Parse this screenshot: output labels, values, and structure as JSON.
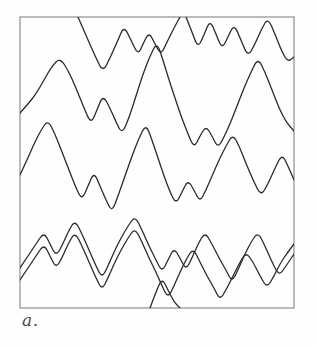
{
  "figure": {
    "panel_label": "a.",
    "caption_position": "bottom-left-outside",
    "background_color": "#fefefe",
    "frame": {
      "x": 20,
      "y": 17,
      "width": 274,
      "height": 291,
      "stroke_color": "#8e8e8e",
      "stroke_width": 1.2
    },
    "trace_style": {
      "stroke_color": "#2b2b2b",
      "stroke_width": 1.3,
      "fill": "none",
      "line_join": "round",
      "line_cap": "round"
    }
  },
  "chart_data": {
    "type": "line",
    "title": "",
    "subtitle": "",
    "xlabel": "",
    "ylabel": "",
    "grid": false,
    "legend": null,
    "axis_ticks": false,
    "xlim": [
      20,
      294
    ],
    "ylim": [
      17,
      308
    ],
    "series": [
      {
        "name": "trace-1",
        "comment": "Topmost trace, enters at top edge, oscillates sharply near top, exits right at top.",
        "path": "M 78 17 L 88 40 L 96 58 L 103 72 L 110 58 L 118 40 L 124 26 L 131 40 L 138 55 L 143 44 L 149 32 L 155 44 L 161 55 L 167 42 L 174 28 L 180 17"
      },
      {
        "name": "trace-2",
        "comment": "Second trace enters top edge near x=185, zigzags across the upper-right region, exits right edge.",
        "path": "M 186 17 L 192 32 L 198 48 L 204 35 L 210 20 L 216 34 L 222 49 L 228 37 L 234 24 L 241 40 L 248 57 L 255 44 L 262 28 L 268 18 L 275 34 L 282 52 L 288 62 L 294 57"
      },
      {
        "name": "trace-3",
        "comment": "Large-amplitude trace starting at left edge mid-upper, tall peaks, travels the full width and exits right.",
        "path": "M 20 113 L 28 104 L 36 94 L 44 80 L 52 66 L 60 58 L 68 70 L 76 88 L 84 108 L 91 124 L 97 110 L 103 95 L 110 108 L 116 122 L 122 134 L 129 118 L 136 96 L 143 74 L 150 56 L 157 42 L 163 60 L 169 80 L 175 98 L 181 116 L 188 134 L 194 148 L 200 136 L 206 126 L 212 136 L 218 148 L 224 137 L 230 124 L 237 106 L 244 88 L 251 72 L 258 58 L 265 72 L 272 90 L 279 108 L 286 122 L 294 131"
      },
      {
        "name": "trace-4",
        "comment": "Mid trace entering left edge lower-middle with a deep V, crossing trace-3 around mid-panel, exits right edge.",
        "path": "M 20 175 L 27 160 L 34 144 L 41 130 L 48 120 L 55 134 L 62 152 L 69 170 L 76 188 L 82 200 L 88 186 L 94 172 L 100 186 L 106 200 L 112 212 L 118 196 L 125 176 L 132 156 L 139 138 L 146 124 L 152 140 L 158 158 L 164 176 L 170 192 L 176 204 L 182 192 L 188 180 L 194 190 L 200 202 L 206 190 L 212 176 L 219 160 L 226 146 L 233 134 L 240 148 L 247 166 L 254 182 L 261 196 L 268 184 L 275 168 L 282 154 L 288 166 L 294 180"
      },
      {
        "name": "trace-5",
        "comment": "Lower trace (outer of the close parallel pair) starting left edge low, small peaks then larger ones, exits right edge near bottom.",
        "path": "M 20 268 L 28 256 L 36 244 L 44 232 L 50 244 L 56 256 L 62 246 L 68 232 L 75 220 L 82 234 L 89 250 L 96 266 L 102 278 L 108 266 L 114 252 L 121 238 L 128 226 L 135 216 L 142 230 L 149 246 L 156 260 L 162 272 L 168 260 L 174 248 L 180 258 L 186 270 L 192 258 L 198 244 L 205 232 L 212 244 L 219 258 L 226 270 L 232 282 L 238 270 L 244 256 L 251 242 L 258 232 L 265 246 L 272 262 L 279 276 L 286 266 L 294 254"
      },
      {
        "name": "trace-6",
        "comment": "Innermost parallel companion trace, offset ~8px below trace-5 on the left half, diverging at the right.",
        "path": "M 20 280 L 28 268 L 36 256 L 44 244 L 50 256 L 56 268 L 62 258 L 68 244 L 75 232 L 82 246 L 89 262 L 96 278 L 102 290 L 108 278 L 114 264 L 121 250 L 128 238 L 135 228 L 142 242 L 149 258 L 156 272 L 162 286 L 168 298 L 174 286 L 180 272 L 186 260 L 193 248 L 200 262 L 207 276 L 214 288 L 220 300 L 226 290 L 232 278 L 239 264 L 246 252 L 253 262 L 260 276 L 267 288 L 274 276 L 281 262 L 288 252 L 294 244"
      },
      {
        "name": "trace-7",
        "comment": "Short bottom trace fragment rising from the bottom edge near x=150 with two small humps before rejoining the lower band.",
        "path": "M 150 308 L 156 292 L 162 278 L 168 290 L 174 302 L 180 308"
      }
    ]
  }
}
